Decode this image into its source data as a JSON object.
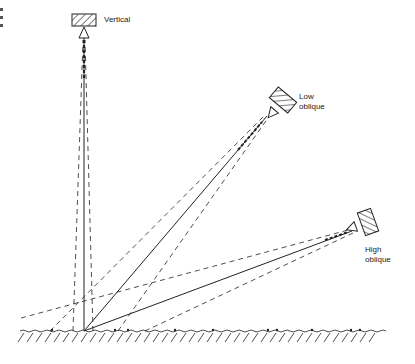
{
  "diagram": {
    "type": "aerial-photography-camera-orientations",
    "cameras": [
      {
        "id": "vertical",
        "label": "Vertical"
      },
      {
        "id": "low-oblique",
        "label_line1": "Low",
        "label_line2": "oblique"
      },
      {
        "id": "high-oblique",
        "label_line1": "High",
        "label_line2": "oblique"
      }
    ],
    "ground": {
      "label": ""
    },
    "colors": {
      "line": "#222222",
      "background": "#ffffff"
    }
  }
}
